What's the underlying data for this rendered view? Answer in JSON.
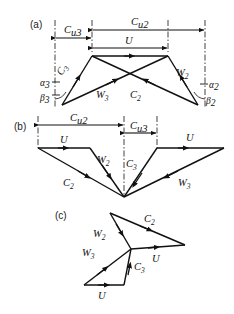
{
  "figure": {
    "background_color": "#ffffff",
    "line_color": "#111111",
    "panels": [
      {
        "id": "a",
        "label": "(a)",
        "dimensions": [
          {
            "name": "Cu3",
            "base": "C",
            "sub": "u3"
          },
          {
            "name": "Cu2",
            "base": "C",
            "sub": "u2"
          },
          {
            "name": "U",
            "base": "U",
            "sub": ""
          }
        ],
        "vectors": [
          {
            "name": "C3",
            "base": "C",
            "sub": "3"
          },
          {
            "name": "W3",
            "base": "W",
            "sub": "3"
          },
          {
            "name": "C2",
            "base": "C",
            "sub": "2"
          },
          {
            "name": "W2",
            "base": "W",
            "sub": "2"
          }
        ],
        "angles": [
          {
            "name": "alpha3",
            "base": "α",
            "sub": "3"
          },
          {
            "name": "beta3",
            "base": "β",
            "sub": "3"
          },
          {
            "name": "alpha2",
            "base": "α",
            "sub": "2"
          },
          {
            "name": "beta2",
            "base": "β",
            "sub": "2"
          }
        ]
      },
      {
        "id": "b",
        "label": "(b)",
        "dimensions": [
          {
            "name": "Cu2",
            "base": "C",
            "sub": "u2"
          },
          {
            "name": "Cu3",
            "base": "C",
            "sub": "u3"
          },
          {
            "name": "U-left",
            "base": "U",
            "sub": ""
          },
          {
            "name": "U-right",
            "base": "U",
            "sub": ""
          }
        ],
        "vectors": [
          {
            "name": "W2",
            "base": "W",
            "sub": "2"
          },
          {
            "name": "C2",
            "base": "C",
            "sub": "2"
          },
          {
            "name": "C3",
            "base": "C",
            "sub": "3"
          },
          {
            "name": "W3",
            "base": "W",
            "sub": "3"
          }
        ],
        "angles": []
      },
      {
        "id": "c",
        "label": "(c)",
        "dimensions": [
          {
            "name": "U-upper",
            "base": "U",
            "sub": ""
          },
          {
            "name": "U-lower",
            "base": "U",
            "sub": ""
          }
        ],
        "vectors": [
          {
            "name": "C2",
            "base": "C",
            "sub": "2"
          },
          {
            "name": "W2",
            "base": "W",
            "sub": "2"
          },
          {
            "name": "W3",
            "base": "W",
            "sub": "3"
          },
          {
            "name": "C3",
            "base": "C",
            "sub": "3"
          }
        ],
        "angles": []
      }
    ]
  }
}
